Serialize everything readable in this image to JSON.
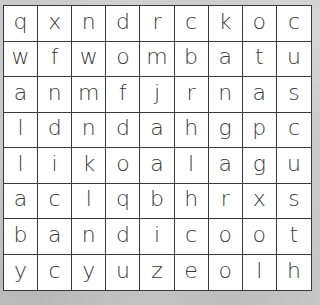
{
  "puzzle": {
    "type": "word-search",
    "rows": 8,
    "columns": 9,
    "grid": [
      [
        "q",
        "x",
        "n",
        "d",
        "r",
        "c",
        "k",
        "o",
        "c"
      ],
      [
        "w",
        "f",
        "w",
        "o",
        "m",
        "b",
        "a",
        "t",
        "u"
      ],
      [
        "a",
        "n",
        "m",
        "f",
        "j",
        "r",
        "n",
        "a",
        "s"
      ],
      [
        "l",
        "d",
        "n",
        "d",
        "a",
        "h",
        "g",
        "p",
        "c"
      ],
      [
        "l",
        "i",
        "k",
        "o",
        "a",
        "l",
        "a",
        "g",
        "u"
      ],
      [
        "a",
        "c",
        "l",
        "q",
        "b",
        "h",
        "r",
        "x",
        "s"
      ],
      [
        "b",
        "a",
        "n",
        "d",
        "i",
        "c",
        "o",
        "o",
        "t"
      ],
      [
        "y",
        "c",
        "y",
        "u",
        "z",
        "e",
        "o",
        "l",
        "h"
      ]
    ]
  },
  "colors": {
    "grid_line": "#3a3a3a",
    "letter": "#3a3a3a",
    "cell_background": "#ffffff",
    "page_background": "#c9c9c9"
  }
}
